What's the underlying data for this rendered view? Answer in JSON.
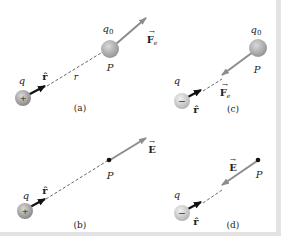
{
  "figure": {
    "colors": {
      "background": "#ffffff",
      "border": "#e3e3e3",
      "sphere_positive": "#9a9a9a",
      "sphere_negative": "#c9c9c9",
      "test_charge": "#a8a8a8",
      "vector_gray": "#8c8c8c",
      "unit_vector": "#111111",
      "dashed_line": "#555555"
    },
    "panels": [
      {
        "id": "a",
        "caption": "(a)",
        "source_charge_label": "q",
        "source_sign": "+",
        "unit_vector_label": "r̂",
        "distance_label": "r",
        "test_charge_label": "q",
        "test_charge_subscript": "0",
        "point_label": "P",
        "vector_label": "F",
        "vector_subscript": "e",
        "vector_direction": "away from q"
      },
      {
        "id": "b",
        "caption": "(b)",
        "source_charge_label": "q",
        "source_sign": "+",
        "unit_vector_label": "r̂",
        "point_label": "P",
        "vector_label": "E",
        "vector_direction": "away from q"
      },
      {
        "id": "c",
        "caption": "(c)",
        "source_charge_label": "q",
        "source_sign": "−",
        "unit_vector_label": "r̂",
        "test_charge_label": "q",
        "test_charge_subscript": "0",
        "point_label": "P",
        "vector_label": "F",
        "vector_subscript": "e",
        "vector_direction": "toward q"
      },
      {
        "id": "d",
        "caption": "(d)",
        "source_charge_label": "q",
        "source_sign": "−",
        "unit_vector_label": "r̂",
        "point_label": "P",
        "vector_label": "E",
        "vector_direction": "toward q"
      }
    ]
  }
}
